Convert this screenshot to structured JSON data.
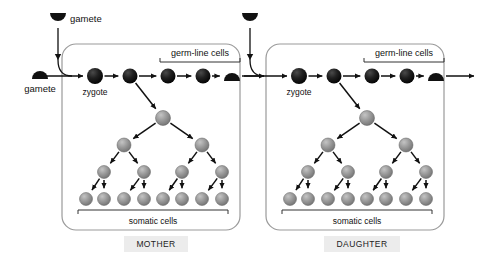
{
  "figure": {
    "background": "#ffffff",
    "panel_border_color": "#9a9a9a",
    "germline_cell_color": "#181818",
    "somatic_cell_color": "#8e8e8e",
    "arrow_color": "#111111",
    "tag_background": "#ececec"
  },
  "external_gametes": [
    {
      "id": "gamete-left",
      "label": "gamete",
      "shape": "dome-up",
      "x": 40,
      "y": 74
    },
    {
      "id": "gamete-top-mother",
      "label": "gamete",
      "shape": "dome-down",
      "x": 58,
      "y": 18
    },
    {
      "id": "gamete-top-daughter",
      "label": "",
      "shape": "dome-down",
      "x": 250,
      "y": 18
    }
  ],
  "panels": [
    {
      "id": "mother",
      "tag": "MOTHER",
      "box": {
        "x": 62,
        "y": 44,
        "w": 178,
        "h": 186
      },
      "tag_box": {
        "x": 124,
        "y": 236,
        "w": 64,
        "h": 16
      },
      "zygote_label": "zygote",
      "germline_label": "germ-line cells",
      "somatic_label": "somatic cells",
      "germline_chain": [
        {
          "type": "cell",
          "x": 95,
          "y": 76,
          "r": 8.0,
          "name": "zygote"
        },
        {
          "type": "cell",
          "x": 130,
          "y": 76,
          "r": 7.5,
          "name": "germline-cell-2"
        },
        {
          "type": "cell",
          "x": 168,
          "y": 76,
          "r": 7.5,
          "name": "germline-cell-3"
        },
        {
          "type": "cell",
          "x": 203,
          "y": 76,
          "r": 7.5,
          "name": "germline-cell-4"
        },
        {
          "type": "gamete",
          "x": 232,
          "y": 76,
          "r": 8.0,
          "name": "germline-gamete"
        }
      ],
      "germline_bracket": {
        "x1": 160,
        "x2": 240,
        "y": 62
      },
      "germline_label_pos": {
        "x": 200,
        "y": 49
      },
      "somatic_bracket": {
        "x1": 78,
        "x2": 228,
        "y": 210
      },
      "somatic_label_pos": {
        "x": 153,
        "y": 217
      },
      "somatic_rows": [
        {
          "r": 7.5,
          "y": 118,
          "xs": [
            163
          ]
        },
        {
          "r": 7.0,
          "y": 145,
          "xs": [
            124,
            202
          ]
        },
        {
          "r": 6.5,
          "y": 172,
          "xs": [
            104,
            144,
            182,
            222
          ]
        },
        {
          "r": 6.5,
          "y": 199,
          "xs": [
            86,
            104,
            124,
            144,
            163,
            182,
            202,
            222
          ]
        }
      ]
    },
    {
      "id": "daughter",
      "tag": "DAUGHTER",
      "box": {
        "x": 266,
        "y": 44,
        "w": 178,
        "h": 186
      },
      "tag_box": {
        "x": 324,
        "y": 236,
        "w": 76,
        "h": 16
      },
      "zygote_label": "zygote",
      "germline_label": "germ-line cells",
      "somatic_label": "somatic cells",
      "germline_chain": [
        {
          "type": "cell",
          "x": 299,
          "y": 76,
          "r": 8.0,
          "name": "zygote"
        },
        {
          "type": "cell",
          "x": 334,
          "y": 76,
          "r": 7.5,
          "name": "germline-cell-2"
        },
        {
          "type": "cell",
          "x": 372,
          "y": 76,
          "r": 7.5,
          "name": "germline-cell-3"
        },
        {
          "type": "cell",
          "x": 407,
          "y": 76,
          "r": 7.5,
          "name": "germline-cell-4"
        },
        {
          "type": "gamete",
          "x": 436,
          "y": 76,
          "r": 8.0,
          "name": "germline-gamete"
        }
      ],
      "germline_bracket": {
        "x1": 364,
        "x2": 444,
        "y": 62
      },
      "germline_label_pos": {
        "x": 404,
        "y": 49
      },
      "somatic_bracket": {
        "x1": 282,
        "x2": 432,
        "y": 210
      },
      "somatic_label_pos": {
        "x": 357,
        "y": 217
      },
      "somatic_rows": [
        {
          "r": 7.5,
          "y": 118,
          "xs": [
            367
          ]
        },
        {
          "r": 7.0,
          "y": 145,
          "xs": [
            328,
            406
          ]
        },
        {
          "r": 6.5,
          "y": 172,
          "xs": [
            308,
            348,
            386,
            426
          ]
        },
        {
          "r": 6.5,
          "y": 199,
          "xs": [
            290,
            308,
            328,
            348,
            367,
            386,
            406,
            426
          ]
        }
      ]
    }
  ]
}
